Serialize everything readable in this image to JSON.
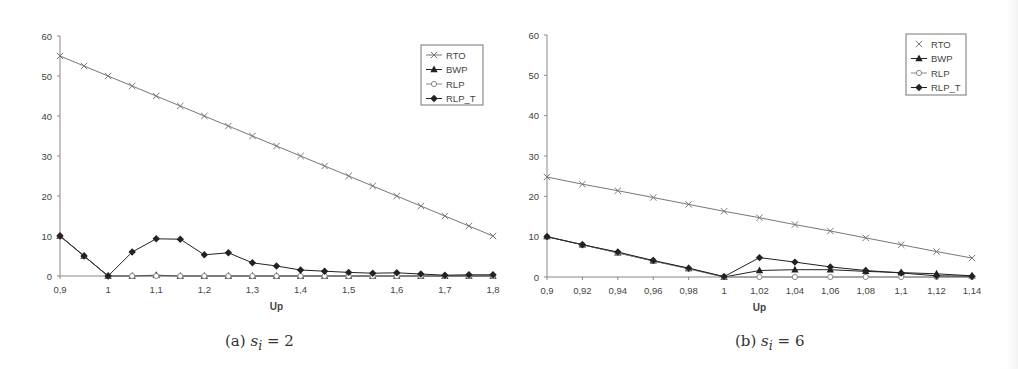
{
  "chart_data": [
    {
      "id": "a",
      "type": "line",
      "title": "",
      "caption": "(a) s_i = 2",
      "caption_prefix": "(a)",
      "caption_var": "s",
      "caption_sub": "i",
      "caption_value": "= 2",
      "xlabel": "Up",
      "ylabel": "",
      "ylim": [
        0,
        60
      ],
      "yticks": [
        0,
        10,
        20,
        30,
        40,
        50,
        60
      ],
      "xlim": [
        0.9,
        1.8
      ],
      "xtick_labels": [
        "0,9",
        "1",
        "1,1",
        "1,2",
        "1,3",
        "1,4",
        "1,5",
        "1,6",
        "1,7",
        "1,8"
      ],
      "grid": false,
      "legend_position": "upper right",
      "x": [
        0.9,
        0.95,
        1.0,
        1.05,
        1.1,
        1.15,
        1.2,
        1.25,
        1.3,
        1.35,
        1.4,
        1.45,
        1.5,
        1.55,
        1.6,
        1.65,
        1.7,
        1.75,
        1.8
      ],
      "series": [
        {
          "name": "RTO",
          "marker": "x",
          "color": "#777777",
          "values": [
            55,
            52.5,
            50,
            47.5,
            45,
            42.5,
            40,
            37.5,
            35,
            32.5,
            30,
            27.5,
            25,
            22.5,
            20,
            17.5,
            15,
            12.5,
            10
          ]
        },
        {
          "name": "BWP",
          "marker": "triangle",
          "color": "#222222",
          "values": [
            10,
            5,
            0,
            0,
            0.2,
            0,
            0,
            0,
            0,
            0,
            0,
            0,
            0,
            0,
            0,
            0,
            0,
            0,
            0
          ]
        },
        {
          "name": "RLP",
          "marker": "circle-open",
          "color": "#888888",
          "values": [
            10,
            5,
            0,
            0,
            0,
            0,
            0,
            0,
            0,
            0,
            0,
            0,
            0,
            0,
            0,
            0,
            0,
            0,
            0
          ]
        },
        {
          "name": "RLP_T",
          "marker": "diamond",
          "color": "#222222",
          "values": [
            10,
            5,
            0,
            6,
            9.3,
            9.2,
            5.3,
            5.8,
            3.3,
            2.5,
            1.5,
            1.2,
            0.9,
            0.7,
            0.8,
            0.5,
            0.2,
            0.3,
            0.3
          ]
        }
      ]
    },
    {
      "id": "b",
      "type": "line",
      "title": "",
      "caption": "(b) s_i = 6",
      "caption_prefix": "(b)",
      "caption_var": "s",
      "caption_sub": "i",
      "caption_value": "= 6",
      "xlabel": "Up",
      "ylabel": "",
      "ylim": [
        0,
        60
      ],
      "yticks": [
        0,
        10,
        20,
        30,
        40,
        50,
        60
      ],
      "xlim": [
        0.9,
        1.14
      ],
      "xtick_labels": [
        "0,9",
        "0,92",
        "0,94",
        "0,96",
        "0,98",
        "1",
        "1,02",
        "1,04",
        "1,06",
        "1,08",
        "1,1",
        "1,12",
        "1,14"
      ],
      "grid": false,
      "legend_position": "upper right",
      "x": [
        0.9,
        0.92,
        0.94,
        0.96,
        0.98,
        1.0,
        1.02,
        1.04,
        1.06,
        1.08,
        1.1,
        1.12,
        1.14
      ],
      "series": [
        {
          "name": "RTO",
          "marker": "x",
          "color": "#777777",
          "values": [
            24.8,
            23,
            21.4,
            19.7,
            18,
            16.3,
            14.7,
            13,
            11.4,
            9.7,
            8,
            6.3,
            4.7
          ]
        },
        {
          "name": "BWP",
          "marker": "triangle",
          "color": "#222222",
          "values": [
            10,
            8,
            6,
            4,
            2.1,
            0,
            1.6,
            1.8,
            1.8,
            1.4,
            1.1,
            0.8,
            0.3
          ]
        },
        {
          "name": "RLP",
          "marker": "circle-open",
          "color": "#888888",
          "values": [
            10,
            8,
            6,
            4,
            2,
            0,
            0,
            0,
            0,
            0,
            0,
            0,
            0
          ]
        },
        {
          "name": "RLP_T",
          "marker": "diamond",
          "color": "#222222",
          "values": [
            10,
            8,
            6.2,
            4.1,
            2.2,
            0.1,
            4.8,
            3.7,
            2.5,
            1.6,
            1.0,
            0.3,
            0.2
          ]
        }
      ]
    }
  ],
  "layout": {
    "a": {
      "x0": 60,
      "x1": 493,
      "y0": 276,
      "y1": 36,
      "legend": {
        "x": 421,
        "y": 45,
        "w": 62,
        "h": 60
      }
    },
    "b": {
      "x0": 42,
      "x1": 467,
      "y0": 277,
      "y1": 35,
      "legend": {
        "x": 401,
        "y": 34,
        "w": 60,
        "h": 61
      }
    }
  }
}
